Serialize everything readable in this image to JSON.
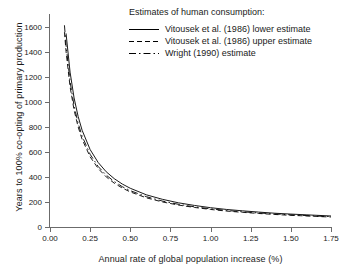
{
  "chart_data": {
    "type": "line",
    "title": "",
    "xlabel": "Annual rate of global population increase (%)",
    "ylabel": "Years to 100% co-opting of primary production",
    "xlim": [
      0.0,
      1.75
    ],
    "ylim": [
      0,
      1700
    ],
    "xticks": [
      "0.00",
      "0.25",
      "0.50",
      "0.75",
      "1.00",
      "1.25",
      "1.50",
      "1.75"
    ],
    "xtick_values": [
      0.0,
      0.25,
      0.5,
      0.75,
      1.0,
      1.25,
      1.5,
      1.75
    ],
    "yticks": [
      "0",
      "200",
      "400",
      "600",
      "800",
      "1000",
      "1200",
      "1400",
      "1600"
    ],
    "ytick_values": [
      0,
      200,
      400,
      600,
      800,
      1000,
      1200,
      1400,
      1600
    ],
    "grid": false,
    "legend_position": "upper-right",
    "legend_title": "Estimates of human consumption:",
    "x": [
      0.09,
      0.1,
      0.125,
      0.15,
      0.175,
      0.2,
      0.25,
      0.3,
      0.35,
      0.4,
      0.45,
      0.5,
      0.6,
      0.7,
      0.8,
      0.9,
      1.0,
      1.1,
      1.2,
      1.3,
      1.4,
      1.5,
      1.6,
      1.7,
      1.75
    ],
    "series": [
      {
        "name": "Vitousek et al. (1986) lower estimate",
        "style": "solid",
        "color": "#000000",
        "values": [
          1710,
          1545,
          1236,
          1030,
          883,
          772,
          618,
          515,
          441,
          386,
          343,
          309,
          257,
          221,
          193,
          172,
          154,
          140,
          129,
          119,
          110,
          103,
          97,
          91,
          88
        ]
      },
      {
        "name": "Vitousek et al. (1986) upper estimate",
        "style": "dashed",
        "color": "#000000",
        "values": [
          1555,
          1400,
          1120,
          933,
          800,
          700,
          560,
          467,
          400,
          350,
          311,
          280,
          233,
          200,
          175,
          156,
          140,
          127,
          117,
          108,
          100,
          93,
          88,
          82,
          80
        ]
      },
      {
        "name": "Wright (1990) estimate",
        "style": "dashdot",
        "color": "#000000",
        "values": [
          1610,
          1450,
          1160,
          967,
          829,
          725,
          580,
          483,
          414,
          363,
          322,
          290,
          242,
          207,
          181,
          161,
          145,
          132,
          121,
          112,
          104,
          97,
          91,
          85,
          83
        ]
      }
    ]
  }
}
